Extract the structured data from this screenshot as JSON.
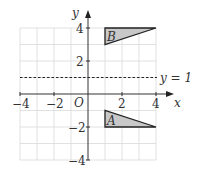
{
  "axes": {
    "x_label": "x",
    "y_label": "y",
    "origin_label": "O",
    "x_ticks": [
      {
        "value": -4,
        "label": "−4"
      },
      {
        "value": -2,
        "label": "−2"
      },
      {
        "value": 2,
        "label": "2"
      },
      {
        "value": 4,
        "label": "4"
      }
    ],
    "y_ticks": [
      {
        "value": 4,
        "label": "4"
      },
      {
        "value": 2,
        "label": "2"
      },
      {
        "value": -2,
        "label": "−2"
      },
      {
        "value": -4,
        "label": "−4"
      }
    ],
    "range": {
      "x": [
        -4,
        4
      ],
      "y": [
        -4,
        4
      ]
    }
  },
  "line": {
    "label": "y = 1",
    "equation": "y=1",
    "style": "dashed"
  },
  "shapes": [
    {
      "name": "A",
      "label": "A",
      "vertices": [
        [
          1,
          -1
        ],
        [
          1,
          -2
        ],
        [
          4,
          -2
        ]
      ],
      "fill": "#c8c8c8"
    },
    {
      "name": "B",
      "label": "B",
      "vertices": [
        [
          1,
          4
        ],
        [
          1,
          3
        ],
        [
          4,
          4
        ]
      ],
      "fill": "#c8c8c8"
    }
  ]
}
